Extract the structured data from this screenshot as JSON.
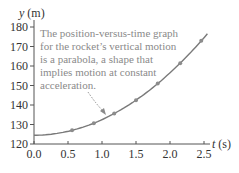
{
  "chart_data": {
    "type": "line",
    "title": "",
    "xlabel": "t (s)",
    "ylabel": "y (m)",
    "xlim": [
      0.0,
      2.5
    ],
    "ylim": [
      120,
      180
    ],
    "xticks": [
      "0.0",
      "0.5",
      "1.0",
      "1.5",
      "2.0",
      "2.5"
    ],
    "yticks": [
      "120",
      "130",
      "140",
      "150",
      "160",
      "170",
      "180"
    ],
    "grid": false,
    "legend": null,
    "series": [
      {
        "name": "rocket vertical position",
        "style": "parabolic curve with markers",
        "x": [
          0.56,
          0.88,
          1.18,
          1.5,
          1.82,
          2.15,
          2.46
        ],
        "y": [
          126.7,
          130.3,
          134.9,
          142.0,
          150.0,
          161.0,
          173.0
        ]
      }
    ],
    "curve": {
      "x0": 0.0,
      "y0": 124.5,
      "x_end": 2.55,
      "y_end": 176.5
    },
    "annotations": [
      {
        "lines": [
          "The position-versus-time graph",
          "for the rocket’s vertical motion",
          "is a parabola, a shape that",
          "implies motion at constant",
          "acceleration."
        ],
        "arrow": "dotted arrow pointing to curve near t = 1.0 s"
      }
    ]
  },
  "colors": {
    "axis": "#555555",
    "curve": "#7a7a7a",
    "marker": "#8c8c8c",
    "annotation_text": "#8a8a8a",
    "tick_text": "#333333"
  }
}
